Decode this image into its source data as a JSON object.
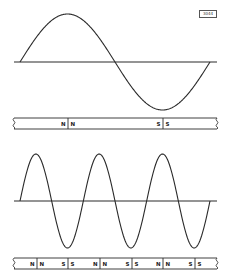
{
  "figure": {
    "badge_label": "3044",
    "colors": {
      "ink": "#2a2a2a",
      "background": "#ffffff"
    }
  },
  "chart_data": [
    {
      "type": "line",
      "title": "Low-frequency sine wave (one cycle)",
      "description": "Single full sine cycle over the axis, generated by one N-N / S-S pole pair",
      "x_range": [
        20,
        210
      ],
      "axis_y": 62,
      "cycles": 1,
      "amplitude_px": 48,
      "peak": {
        "x": 68,
        "y": 13
      },
      "trough": {
        "x": 163,
        "y": 109
      }
    },
    {
      "type": "line",
      "title": "Higher-frequency sine wave (three cycles)",
      "description": "Three full sine cycles over the same length, generated by multiple alternating pole pairs",
      "x_range": [
        20,
        210
      ],
      "axis_y": 201,
      "cycles": 3,
      "amplitude_px": 47,
      "peaks_x": [
        37,
        100,
        163
      ],
      "troughs_x": [
        68,
        132,
        195
      ]
    }
  ],
  "magnet_bars": [
    {
      "name": "bar-1",
      "segments": [
        {
          "divider_x": 68,
          "left_label": "N",
          "right_label": "N"
        },
        {
          "divider_x": 163,
          "left_label": "S",
          "right_label": "S"
        }
      ]
    },
    {
      "name": "bar-2",
      "segments": [
        {
          "divider_x": 37,
          "left_label": "N",
          "right_label": "N"
        },
        {
          "divider_x": 68,
          "left_label": "S",
          "right_label": "S"
        },
        {
          "divider_x": 100,
          "left_label": "N",
          "right_label": "N"
        },
        {
          "divider_x": 132,
          "left_label": "S",
          "right_label": "S"
        },
        {
          "divider_x": 163,
          "left_label": "N",
          "right_label": "N"
        },
        {
          "divider_x": 195,
          "left_label": "S",
          "right_label": "S"
        }
      ]
    }
  ]
}
